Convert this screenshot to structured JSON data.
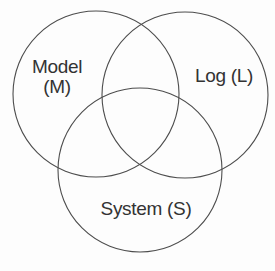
{
  "diagram": {
    "type": "venn",
    "sets": [
      {
        "id": "M",
        "label": "Model (M)",
        "label_line1": "Model",
        "label_line2": "(M)",
        "position": "top-left"
      },
      {
        "id": "L",
        "label": "Log (L)",
        "position": "top-right"
      },
      {
        "id": "S",
        "label": "System (S)",
        "position": "bottom-center"
      }
    ]
  },
  "colors": {
    "circle_stroke": "#4d4d4d",
    "label_text": "#333333",
    "background": "#fdfdfd"
  }
}
